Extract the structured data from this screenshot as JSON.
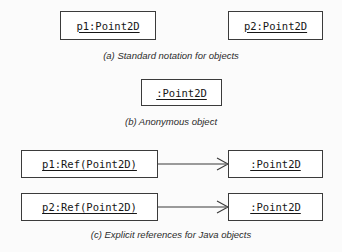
{
  "figure": {
    "background_color": "#fbfbfb",
    "box_border_color": "#3b3b3b",
    "box_fill_color": "#ffffff",
    "text_color": "#161616",
    "caption_color": "#2b2b2b"
  },
  "sections": {
    "a": {
      "caption": "(a) Standard notation for objects",
      "boxes": [
        {
          "label": "p1:Point2D",
          "underlined": true
        },
        {
          "label": "p2:Point2D",
          "underlined": true
        }
      ]
    },
    "b": {
      "caption": "(b) Anonymous object",
      "boxes": [
        {
          "label": ":Point2D",
          "underlined": true
        }
      ]
    },
    "c": {
      "caption": "(c) Explicit references for Java objects",
      "rows": [
        {
          "source": {
            "label": "p1:Ref(Point2D)",
            "underlined": true
          },
          "connector": {
            "type": "open-arrow",
            "direction": "right"
          },
          "target": {
            "label": ":Point2D",
            "underlined": true
          }
        },
        {
          "source": {
            "label": "p2:Ref(Point2D)",
            "underlined": true
          },
          "connector": {
            "type": "open-arrow",
            "direction": "right"
          },
          "target": {
            "label": ":Point2D",
            "underlined": true
          }
        }
      ]
    }
  }
}
